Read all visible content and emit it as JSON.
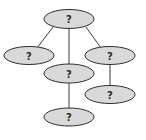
{
  "diagram": {
    "type": "tree",
    "colors": {
      "node_fill": "#d9d9d9",
      "node_stroke": "#2e2e2e",
      "edge": "#3a3a3a",
      "text": "#2a2a2a"
    },
    "nodes": [
      {
        "id": "root",
        "label": "?"
      },
      {
        "id": "left",
        "label": "?"
      },
      {
        "id": "middle",
        "label": "?"
      },
      {
        "id": "right",
        "label": "?"
      },
      {
        "id": "middle-child",
        "label": "?"
      },
      {
        "id": "right-child",
        "label": "?"
      }
    ],
    "edges": [
      {
        "from": "root",
        "to": "left"
      },
      {
        "from": "root",
        "to": "middle"
      },
      {
        "from": "root",
        "to": "right"
      },
      {
        "from": "middle",
        "to": "middle-child"
      },
      {
        "from": "right",
        "to": "right-child"
      }
    ]
  }
}
